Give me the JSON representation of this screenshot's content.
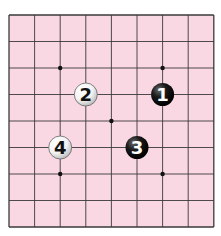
{
  "board": {
    "background": "#f9d7e3",
    "line_color": "#3a3a3a",
    "origin": {
      "x": 9,
      "y": 15
    },
    "cols": 9,
    "rows": 9,
    "cell_w": 25.6,
    "cell_h": 26.5,
    "star_points": [
      [
        2,
        2
      ],
      [
        6,
        2
      ],
      [
        4,
        4
      ],
      [
        2,
        6
      ],
      [
        6,
        6
      ]
    ]
  },
  "stones": [
    {
      "label": "1",
      "color": "black",
      "col": 6,
      "row": 3
    },
    {
      "label": "2",
      "color": "white",
      "col": 3,
      "row": 3
    },
    {
      "label": "3",
      "color": "black",
      "col": 5,
      "row": 5
    },
    {
      "label": "4",
      "color": "white",
      "col": 2,
      "row": 5
    }
  ]
}
